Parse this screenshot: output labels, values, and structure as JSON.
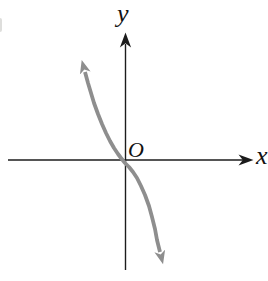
{
  "figure": {
    "background_color": "#ffffff",
    "axis_color": "#1c1c1c",
    "curve_color": "#8e8e8e",
    "y_axis_label": "y",
    "x_axis_label": "x",
    "origin_label": "O"
  },
  "chart_data": {
    "type": "line",
    "title": "",
    "xlabel": "x",
    "ylabel": "y",
    "origin_label": "O",
    "grid": false,
    "tick_labels": [],
    "legend": null,
    "axis_arrows": true,
    "curve_style": {
      "color": "#8e8e8e",
      "thickness_px": 3.8,
      "arrows_both_ends": true
    },
    "implied_function": "decreasing cubic-shaped curve through the origin (resembles y = -x^3); no numeric scale shown",
    "render_points_px": [
      [
        85,
        72
      ],
      [
        88,
        83
      ],
      [
        91,
        93
      ],
      [
        94,
        103
      ],
      [
        98,
        114
      ],
      [
        102,
        124
      ],
      [
        106,
        133
      ],
      [
        110,
        141
      ],
      [
        114,
        148
      ],
      [
        118,
        154
      ],
      [
        121,
        158
      ],
      [
        125,
        163
      ],
      [
        129,
        167
      ],
      [
        133,
        172
      ],
      [
        137,
        178
      ],
      [
        141,
        186
      ],
      [
        145,
        195
      ],
      [
        149,
        206
      ],
      [
        152,
        217
      ],
      [
        155,
        229
      ],
      [
        157,
        240
      ],
      [
        160,
        252
      ]
    ]
  }
}
